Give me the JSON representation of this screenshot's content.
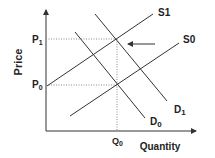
{
  "diagram": {
    "type": "supply-demand",
    "axes": {
      "y_label": "Price",
      "x_label": "Quantity"
    },
    "price_ticks": [
      {
        "base": "P",
        "sub": "1"
      },
      {
        "base": "P",
        "sub": "0"
      }
    ],
    "quantity_ticks": [
      {
        "base": "Q",
        "sub": "0"
      }
    ],
    "curves": {
      "s1": "S1",
      "s0": "S0",
      "d1": {
        "base": "D",
        "sub": "1"
      },
      "d0": {
        "base": "D",
        "sub": "0"
      }
    },
    "annotation": "arrow pointing to S1/D1 equilibrium",
    "colors": {
      "line": "#333333",
      "dotted": "#888888",
      "text": "#222222"
    }
  }
}
